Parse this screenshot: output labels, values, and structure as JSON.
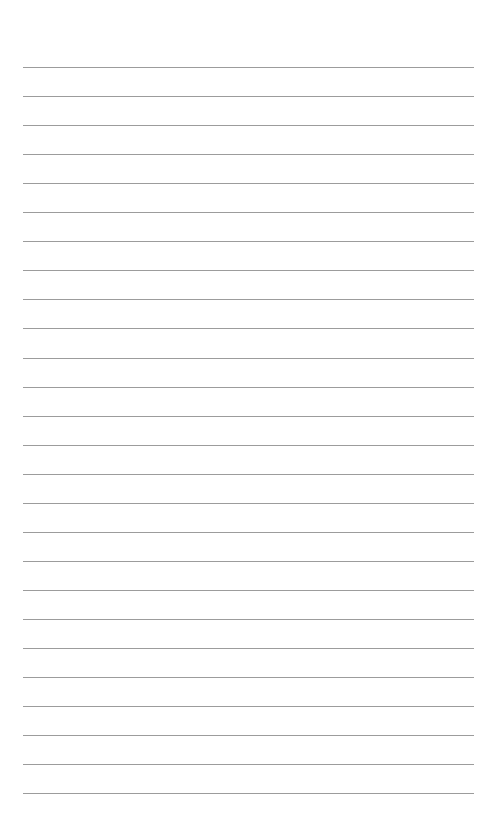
{
  "page": {
    "type": "lined-paper",
    "background_color": "#ffffff",
    "line_color": "#9c9c9c",
    "line_count": 26,
    "first_line_y": 67,
    "line_spacing": 29.05,
    "line_left": 23,
    "line_right": 474
  },
  "header": {
    "remnant_text": ""
  }
}
